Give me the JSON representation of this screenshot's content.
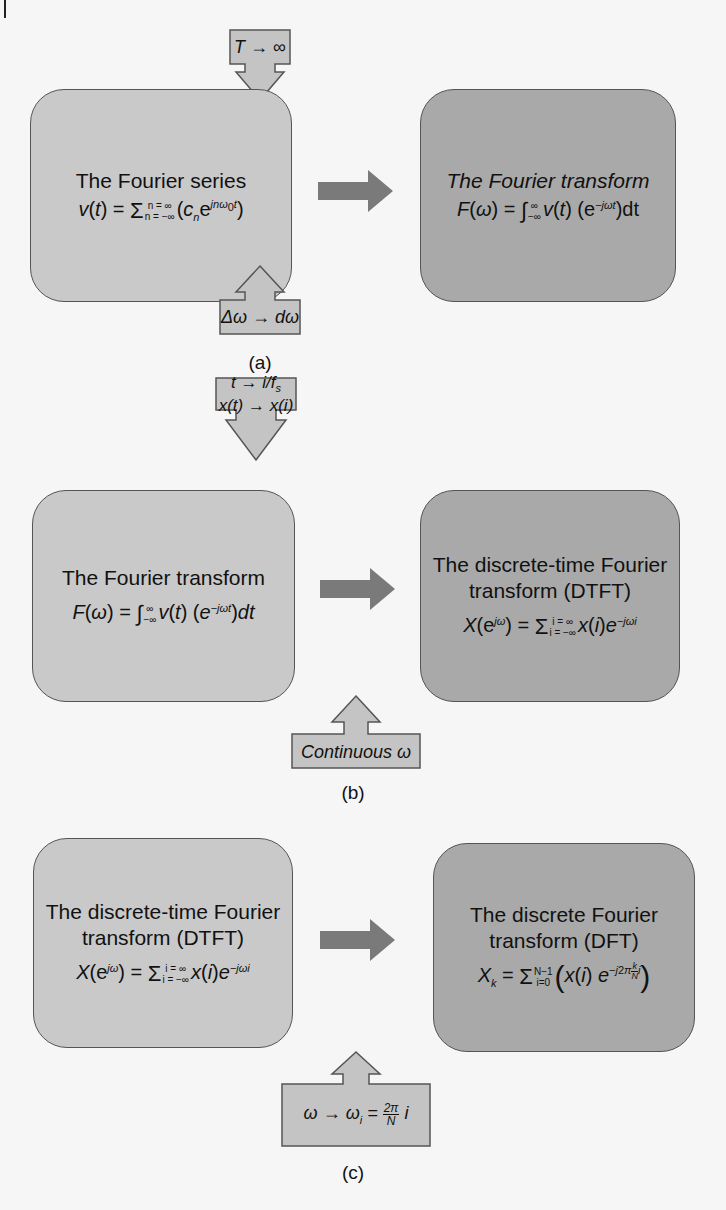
{
  "figure": {
    "panels": [
      {
        "label": "(a)",
        "left_box": {
          "title": "The Fourier series",
          "formula": "v(t) = Σ_{n=−∞}^{n=∞}(c_n e^{jnω₀t})"
        },
        "right_box": {
          "title": "The Fourier transform",
          "formula": "F(ω) = ∫_{−∞}^{∞} v(t) (e^{−jωt})dt"
        },
        "top_condition": "T → ∞",
        "bottom_condition": "Δω → dω"
      },
      {
        "label": "(b)",
        "left_box": {
          "title": "The Fourier transform",
          "formula": "F(ω) = ∫_{−∞}^{∞} v(t) (e^{−jωt})dt"
        },
        "right_box": {
          "title_line1": "The discrete-time Fourier",
          "title_line2": "transform (DTFT)",
          "formula": "X(e^{jω}) = Σ_{i=−∞}^{i=∞} x(i)e^{−jωi}"
        },
        "top_condition_line1": "t → i/f_s",
        "top_condition_line2": "x(t) → x(i)",
        "bottom_condition": "Continuous ω"
      },
      {
        "label": "(c)",
        "left_box": {
          "title_line1": "The discrete-time Fourier",
          "title_line2": "transform (DTFT)",
          "formula": "X(e^{jω}) = Σ_{i=−∞}^{i=∞} x(i)e^{−jωi}"
        },
        "right_box": {
          "title_line1": "The discrete Fourier",
          "title_line2": "transform (DFT)",
          "formula": "X_k = Σ_{i=0}^{N−1}(x(i) e^{−j2π(k/N)i})"
        },
        "bottom_condition": "ω → ω_i = (2π/N) i"
      }
    ],
    "glyphs": {
      "sigma": "Σ",
      "integral": "∫",
      "arrow": "→",
      "inf": "∞",
      "neg_inf": "−∞",
      "omega": "ω",
      "delta": "Δ",
      "pi": "π",
      "minus": "−"
    },
    "colors": {
      "background": "#f6f6f6",
      "box_light": "#c9c9c9",
      "box_dark": "#a9a9a9",
      "arrow_dark": "#7a7a7a",
      "arrow_light": "#c4c4c4",
      "border": "#555555"
    }
  }
}
